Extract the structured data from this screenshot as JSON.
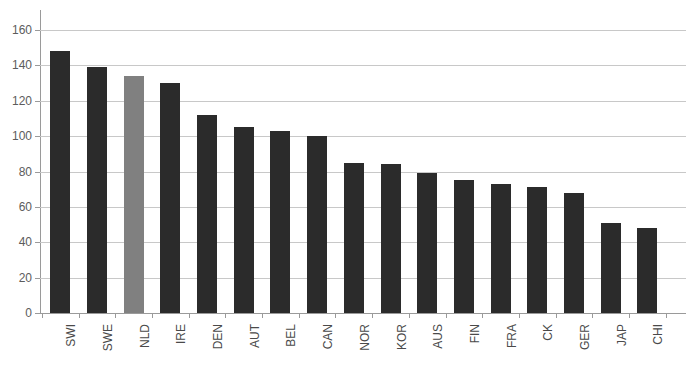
{
  "chart_data": {
    "type": "bar",
    "title": "",
    "xlabel": "",
    "ylabel": "",
    "ylim": [
      0,
      160
    ],
    "ytick_step": 20,
    "yticks": [
      0,
      20,
      40,
      60,
      80,
      100,
      120,
      140,
      160
    ],
    "grid": "horizontal",
    "legend": "none",
    "categories": [
      "SWI",
      "SWE",
      "NLD",
      "IRE",
      "DEN",
      "AUT",
      "BEL",
      "CAN",
      "NOR",
      "KOR",
      "AUS",
      "FIN",
      "FRA",
      "CK",
      "GER",
      "JAP",
      "CHI"
    ],
    "values": [
      148,
      139,
      134,
      130,
      112,
      105,
      103,
      100,
      85,
      84,
      79,
      75,
      73,
      71,
      68,
      51,
      48
    ],
    "highlight_category": "NLD",
    "bar_color": "#2b2b2b",
    "highlight_color": "#808080",
    "gridline_color": "#c8c8c8",
    "axis_color": "#9a9a9a",
    "tick_label_color": "#5c5c5c"
  }
}
